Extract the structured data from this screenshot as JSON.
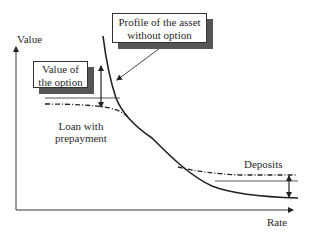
{
  "diagram": {
    "axes": {
      "y_label": "Value",
      "x_label": "Rate"
    },
    "callouts": {
      "profile": {
        "line1": "Profile of the asset",
        "line2": "without option"
      },
      "option_value": {
        "line1": "Value of",
        "line2": "the option"
      }
    },
    "labels": {
      "loan_line1": "Loan with",
      "loan_line2": "prepayment",
      "deposits": "Deposits"
    },
    "curves": [
      {
        "name": "Profile of the asset without option",
        "style": "solid"
      },
      {
        "name": "Loan with prepayment",
        "style": "dash-dot"
      },
      {
        "name": "Deposits",
        "style": "dash-dot"
      }
    ],
    "colors": {
      "line": "#222222",
      "shadow": "#555555",
      "background": "#ffffff"
    }
  }
}
